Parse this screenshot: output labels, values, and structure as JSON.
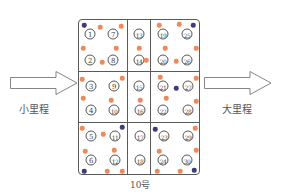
{
  "diagram": {
    "title": "10号",
    "left_arrow": {
      "label": "小里程",
      "direction": "right"
    },
    "right_arrow": {
      "label": "大里程",
      "direction": "right"
    },
    "colors": {
      "orange_dot": "#ec8a5e",
      "navy_dot": "#3b3b7e",
      "line": "#5a5a5a"
    },
    "cells": [
      {
        "id": "1",
        "x": 90,
        "y": 34
      },
      {
        "id": "7",
        "x": 113,
        "y": 34
      },
      {
        "id": "2",
        "x": 90,
        "y": 60
      },
      {
        "id": "8",
        "x": 113,
        "y": 60
      },
      {
        "id": "3",
        "x": 91,
        "y": 86
      },
      {
        "id": "9",
        "x": 114,
        "y": 86
      },
      {
        "id": "4",
        "x": 91,
        "y": 110
      },
      {
        "id": "10",
        "x": 114,
        "y": 110
      },
      {
        "id": "5",
        "x": 91,
        "y": 136
      },
      {
        "id": "11",
        "x": 115,
        "y": 136
      },
      {
        "id": "6",
        "x": 91,
        "y": 160
      },
      {
        "id": "12",
        "x": 115,
        "y": 160
      },
      {
        "id": "13",
        "x": 139,
        "y": 34
      },
      {
        "id": "14",
        "x": 139,
        "y": 60
      },
      {
        "id": "15",
        "x": 139,
        "y": 86
      },
      {
        "id": "16",
        "x": 140,
        "y": 110
      },
      {
        "id": "17",
        "x": 140,
        "y": 136
      },
      {
        "id": "18",
        "x": 140,
        "y": 160
      },
      {
        "id": "19",
        "x": 163,
        "y": 34
      },
      {
        "id": "25",
        "x": 187,
        "y": 34
      },
      {
        "id": "20",
        "x": 163,
        "y": 60
      },
      {
        "id": "26",
        "x": 187,
        "y": 60
      },
      {
        "id": "21",
        "x": 163,
        "y": 86
      },
      {
        "id": "27",
        "x": 188,
        "y": 86
      },
      {
        "id": "22",
        "x": 163,
        "y": 110
      },
      {
        "id": "28",
        "x": 188,
        "y": 110
      },
      {
        "id": "23",
        "x": 164,
        "y": 136
      },
      {
        "id": "29",
        "x": 188,
        "y": 136
      },
      {
        "id": "24",
        "x": 163,
        "y": 160
      },
      {
        "id": "30",
        "x": 187,
        "y": 160
      }
    ],
    "dots": [
      {
        "color": "navy",
        "x": 84,
        "y": 25
      },
      {
        "color": "orange",
        "x": 100,
        "y": 27
      },
      {
        "color": "orange",
        "x": 121,
        "y": 26
      },
      {
        "color": "orange",
        "x": 83,
        "y": 48
      },
      {
        "color": "orange",
        "x": 116,
        "y": 48
      },
      {
        "color": "orange",
        "x": 102,
        "y": 62
      },
      {
        "color": "orange",
        "x": 139,
        "y": 48
      },
      {
        "color": "orange",
        "x": 146,
        "y": 60
      },
      {
        "color": "orange",
        "x": 159,
        "y": 25
      },
      {
        "color": "orange",
        "x": 179,
        "y": 24
      },
      {
        "color": "navy",
        "x": 193,
        "y": 25
      },
      {
        "color": "orange",
        "x": 165,
        "y": 48
      },
      {
        "color": "orange",
        "x": 196,
        "y": 48
      },
      {
        "color": "orange",
        "x": 176,
        "y": 61
      },
      {
        "color": "orange",
        "x": 82,
        "y": 79
      },
      {
        "color": "orange",
        "x": 122,
        "y": 78
      },
      {
        "color": "orange",
        "x": 83,
        "y": 98
      },
      {
        "color": "orange",
        "x": 111,
        "y": 100
      },
      {
        "color": "orange",
        "x": 140,
        "y": 100
      },
      {
        "color": "orange",
        "x": 160,
        "y": 77
      },
      {
        "color": "navy",
        "x": 176,
        "y": 88
      },
      {
        "color": "orange",
        "x": 196,
        "y": 78
      },
      {
        "color": "orange",
        "x": 166,
        "y": 98
      },
      {
        "color": "orange",
        "x": 196,
        "y": 101
      },
      {
        "color": "orange",
        "x": 82,
        "y": 128
      },
      {
        "color": "navy",
        "x": 122,
        "y": 127
      },
      {
        "color": "orange",
        "x": 103,
        "y": 134
      },
      {
        "color": "orange",
        "x": 85,
        "y": 151
      },
      {
        "color": "orange",
        "x": 114,
        "y": 150
      },
      {
        "color": "navy",
        "x": 84,
        "y": 171
      },
      {
        "color": "orange",
        "x": 107,
        "y": 171
      },
      {
        "color": "orange",
        "x": 122,
        "y": 171
      },
      {
        "color": "navy",
        "x": 155,
        "y": 129
      },
      {
        "color": "orange",
        "x": 195,
        "y": 128
      },
      {
        "color": "orange",
        "x": 159,
        "y": 151
      },
      {
        "color": "orange",
        "x": 196,
        "y": 150
      },
      {
        "color": "orange",
        "x": 157,
        "y": 171
      },
      {
        "color": "orange",
        "x": 180,
        "y": 171
      },
      {
        "color": "navy",
        "x": 194,
        "y": 170
      }
    ]
  }
}
